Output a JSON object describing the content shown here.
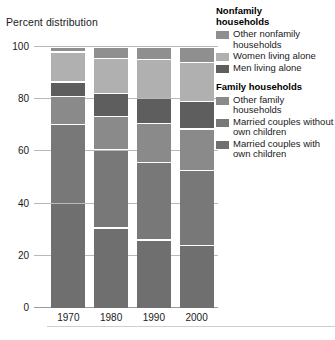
{
  "chart_data": {
    "type": "bar",
    "subtype": "stacked-percent",
    "title": "Percent distribution",
    "xlabel": "",
    "ylabel": "Percent distribution",
    "ylim": [
      0,
      100
    ],
    "yticks": [
      0,
      20,
      40,
      60,
      80,
      100
    ],
    "grid": true,
    "legend_position": "right",
    "categories": [
      "1970",
      "1980",
      "1990",
      "2000"
    ],
    "series": [
      {
        "name": "Married couples with own children",
        "group": "Family households",
        "color": "#6f6f6f",
        "values": [
          40.3,
          30.9,
          26.3,
          24.1
        ]
      },
      {
        "name": "Married couples without own children",
        "group": "Family households",
        "color": "#787878",
        "values": [
          30.3,
          29.9,
          29.8,
          28.7
        ]
      },
      {
        "name": "Other family households",
        "group": "Family households",
        "color": "#8a8a8a",
        "values": [
          10.6,
          12.9,
          14.8,
          16.0
        ]
      },
      {
        "name": "Men living alone",
        "group": "Nonfamily households",
        "color": "#5e5e5e",
        "values": [
          5.6,
          8.6,
          9.7,
          10.7
        ]
      },
      {
        "name": "Women living alone",
        "group": "Nonfamily households",
        "color": "#b0b0b0",
        "values": [
          11.5,
          13.4,
          14.9,
          14.8
        ]
      },
      {
        "name": "Other nonfamily households",
        "group": "Nonfamily households",
        "color": "#8f8f8f",
        "values": [
          1.7,
          4.3,
          4.5,
          5.7
        ]
      }
    ]
  },
  "legend": {
    "groups": [
      {
        "title_line1": "Nonfamily",
        "title_line2": "households",
        "items": [
          {
            "label": "Other nonfamily households",
            "color": "#8f8f8f"
          },
          {
            "label": "Women living alone",
            "color": "#b0b0b0"
          },
          {
            "label": "Men living alone",
            "color": "#5e5e5e"
          }
        ]
      },
      {
        "title_line1": "Family households",
        "title_line2": "",
        "items": [
          {
            "label": "Other family households",
            "color": "#8a8a8a"
          },
          {
            "label": "Married couples without own children",
            "color": "#787878"
          },
          {
            "label": "Married couples with own children",
            "color": "#6f6f6f"
          }
        ]
      }
    ]
  },
  "footer": {
    "note": ""
  }
}
